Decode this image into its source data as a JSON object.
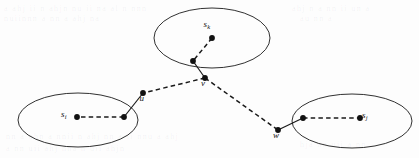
{
  "figure": {
    "type": "diagram",
    "subtype": "graph-clusters",
    "width": 419,
    "height": 158,
    "background_color": "#fdfdfd",
    "stroke_color": "#1a1a1a",
    "node_fill_color": "#111111",
    "clusters": [
      {
        "id": "cluster-top",
        "name": "top-cluster",
        "cx": 212,
        "cy": 38,
        "rx": 58,
        "ry": 30
      },
      {
        "id": "cluster-left",
        "name": "left-cluster",
        "cx": 78,
        "cy": 120,
        "rx": 60,
        "ry": 27
      },
      {
        "id": "cluster-right",
        "name": "right-cluster",
        "cx": 352,
        "cy": 121,
        "rx": 60,
        "ry": 27
      }
    ],
    "nodes": [
      {
        "id": "sk",
        "label": "s",
        "sub": "k",
        "x": 212,
        "y": 38,
        "label_dx": -5,
        "label_dy": -14,
        "labeled": true
      },
      {
        "id": "tb",
        "label": "",
        "sub": "",
        "x": 193,
        "y": 61,
        "label_dx": 0,
        "label_dy": 0,
        "labeled": false
      },
      {
        "id": "v",
        "label": "v",
        "sub": "",
        "x": 205,
        "y": 78,
        "label_dx": -2,
        "label_dy": 5,
        "labeled": true
      },
      {
        "id": "u",
        "label": "u",
        "sub": "",
        "x": 143,
        "y": 93,
        "label_dx": -1,
        "label_dy": 5,
        "labeled": true
      },
      {
        "id": "lb",
        "label": "",
        "sub": "",
        "x": 124,
        "y": 117,
        "label_dx": 0,
        "label_dy": 0,
        "labeled": false
      },
      {
        "id": "si",
        "label": "s",
        "sub": "i",
        "x": 77,
        "y": 117,
        "label_dx": -13,
        "label_dy": -3,
        "labeled": true
      },
      {
        "id": "w",
        "label": "w",
        "sub": "",
        "x": 278,
        "y": 130,
        "label_dx": -2,
        "label_dy": 5,
        "labeled": true
      },
      {
        "id": "rb",
        "label": "",
        "sub": "",
        "x": 303,
        "y": 118,
        "label_dx": 0,
        "label_dy": 0,
        "labeled": false
      },
      {
        "id": "sj",
        "label": "s",
        "sub": "j",
        "x": 360,
        "y": 118,
        "label_dx": 5,
        "label_dy": -3,
        "labeled": true
      }
    ],
    "edges": [
      {
        "from": "sk",
        "to": "tb",
        "style": "dashed",
        "name": "edge-sk-top-boundary"
      },
      {
        "from": "tb",
        "to": "v",
        "style": "solid",
        "name": "edge-top-boundary-v"
      },
      {
        "from": "v",
        "to": "u",
        "style": "dashed",
        "name": "edge-v-u"
      },
      {
        "from": "u",
        "to": "lb",
        "style": "solid",
        "name": "edge-u-left-boundary"
      },
      {
        "from": "lb",
        "to": "si",
        "style": "dashed",
        "name": "edge-left-boundary-si"
      },
      {
        "from": "v",
        "to": "w",
        "style": "dashed",
        "name": "edge-v-w"
      },
      {
        "from": "w",
        "to": "rb",
        "style": "solid",
        "name": "edge-w-right-boundary"
      },
      {
        "from": "rb",
        "to": "sj",
        "style": "dashed",
        "name": "edge-right-boundary-sj"
      }
    ],
    "bleed_artifacts": [
      {
        "text": "a  ahj  ii n    ahjn  nu  ii  na     al   n    nnn",
        "x": 4,
        "y": 4
      },
      {
        "text": "nuiinnn  a     nn   a   ahj  na",
        "x": 4,
        "y": 14
      },
      {
        "text": "ahj  n   a  nn  ii  un  a",
        "x": 292,
        "y": 4
      },
      {
        "text": "au   nn   a",
        "x": 300,
        "y": 14
      },
      {
        "text": "nn  a  uhn   a  nnii    n   ahj  nn  a  ii   nnu  a   ahj",
        "x": 6,
        "y": 132
      },
      {
        "text": "a nn  uii  ahj   nna  n  uii   ahjn",
        "x": 6,
        "y": 144
      },
      {
        "text": "hja  nn  uii   a   nn",
        "x": 300,
        "y": 140
      }
    ]
  }
}
